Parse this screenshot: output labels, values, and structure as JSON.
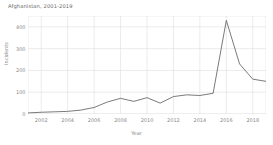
{
  "chart_data": {
    "type": "line",
    "title": "Afghanistan, 2001-2019",
    "xlabel": "Year",
    "ylabel": "Incidents",
    "x": [
      2001,
      2002,
      2003,
      2004,
      2005,
      2006,
      2007,
      2008,
      2009,
      2010,
      2011,
      2012,
      2013,
      2014,
      2015,
      2016,
      2017,
      2018,
      2019
    ],
    "values": [
      5,
      8,
      10,
      12,
      18,
      30,
      55,
      72,
      58,
      75,
      50,
      80,
      88,
      85,
      95,
      430,
      230,
      160,
      150
    ],
    "xlim": [
      2001,
      2019
    ],
    "ylim": [
      0,
      450
    ],
    "xticks": [
      2002,
      2004,
      2006,
      2008,
      2010,
      2012,
      2014,
      2016,
      2018
    ],
    "xticklabels": [
      "2002",
      "2004",
      "2006",
      "2008",
      "2010",
      "2012",
      "2014",
      "2016",
      "2018"
    ],
    "yticks": [
      0,
      100,
      200,
      300,
      400
    ],
    "yticklabels": [
      "0",
      "100",
      "200",
      "300",
      "400"
    ],
    "grid": true,
    "legend": null,
    "line_color": "#6b6b6b",
    "grid_color": "#dddddd",
    "text_color": "#8a8a8a",
    "title_color": "#6b6b6b",
    "background_color": "#ffffff"
  }
}
